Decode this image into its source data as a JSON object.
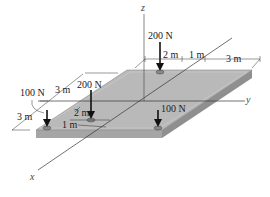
{
  "figure": {
    "type": "statics-plate-diagram",
    "axes": {
      "x": "x",
      "y": "y",
      "z": "z"
    },
    "forces": [
      {
        "id": "f_back_200",
        "label": "200 N"
      },
      {
        "id": "f_left_200",
        "label": "200 N"
      },
      {
        "id": "f_left_100",
        "label": "100 N"
      },
      {
        "id": "f_right_100",
        "label": "100 N"
      }
    ],
    "dimensions": {
      "top_2m": "2 m",
      "top_1m": "1 m",
      "top_3m": "3 m",
      "left_3m_upper": "3 m",
      "left_3m_lower": "3 m",
      "inner_2m": "2 m",
      "inner_1m": "1 m"
    },
    "colors": {
      "plate_top": "#b9b9b9",
      "plate_side": "#9a9a9a",
      "line": "#333333",
      "background": "#ffffff"
    }
  }
}
